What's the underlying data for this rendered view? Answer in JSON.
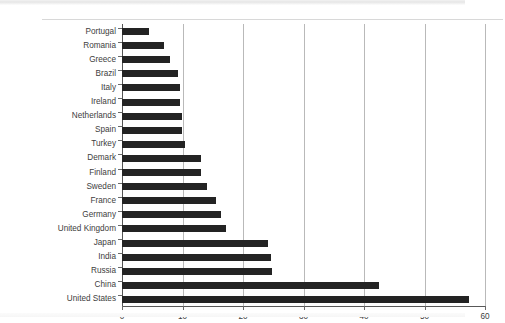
{
  "chart_data": {
    "type": "bar",
    "orientation": "horizontal",
    "title": "",
    "subtitle": "",
    "xlabel": "",
    "ylabel": "",
    "xlim": [
      0,
      60
    ],
    "xticks": [
      0,
      10,
      20,
      30,
      40,
      50,
      60
    ],
    "xtick_labels": [
      "0",
      "10",
      "20",
      "30",
      "40",
      "50",
      "60"
    ],
    "grid": "vertical",
    "legend": "none",
    "bar_color": "#232323",
    "gridline_color": "#b9b9b9",
    "axis_color": "#585858",
    "categories": [
      "Portugal",
      "Romania",
      "Greece",
      "Brazil",
      "Italy",
      "Ireland",
      "Netherlands",
      "Spain",
      "Turkey",
      "Demark",
      "Finland",
      "Sweden",
      "France",
      "Germany",
      "United Kingdom",
      "Japan",
      "India",
      "Russia",
      "China",
      "United States"
    ],
    "values": [
      4.4,
      7.0,
      8.0,
      9.2,
      9.6,
      9.6,
      9.9,
      9.9,
      10.4,
      13.0,
      13.1,
      14.0,
      15.5,
      16.4,
      17.2,
      24.1,
      24.7,
      24.8,
      42.4,
      57.3
    ],
    "series": [
      {
        "name": "",
        "values": [
          4.4,
          7.0,
          8.0,
          9.2,
          9.6,
          9.6,
          9.9,
          9.9,
          10.4,
          13.0,
          13.1,
          14.0,
          15.5,
          16.4,
          17.2,
          24.1,
          24.7,
          24.8,
          42.4,
          57.3
        ]
      }
    ]
  }
}
